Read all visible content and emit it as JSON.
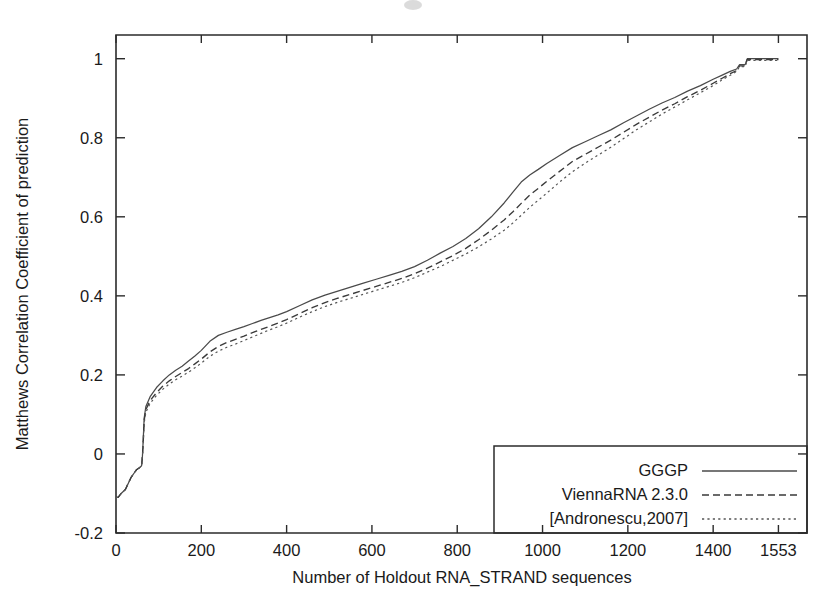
{
  "chart_data": {
    "type": "line",
    "title": "",
    "subtitle": "",
    "xlabel": "Number of Holdout RNA_STRAND sequences",
    "ylabel": "Matthews Correlation Coefficient of prediction",
    "xlim": [
      0,
      1620
    ],
    "ylim": [
      -0.2,
      1.06
    ],
    "grid": false,
    "legend_position": "bottom-right",
    "xticks": [
      0,
      200,
      400,
      600,
      800,
      1000,
      1200,
      1400,
      1553
    ],
    "xticklabels": [
      "0",
      "200",
      "400",
      "600",
      "800",
      "1000",
      "1200",
      "1400",
      "1553"
    ],
    "yticks": [
      -0.2,
      0,
      0.2,
      0.4,
      0.6,
      0.8,
      1
    ],
    "yticklabels": [
      "-0.2",
      "0",
      "0.2",
      "0.4",
      "0.6",
      "0.8",
      "1"
    ],
    "series": [
      {
        "name": "GGGP",
        "style": "solid",
        "color": "#4a4a4a",
        "x": [
          0,
          5,
          12,
          22,
          35,
          48,
          55,
          60,
          62,
          64,
          66,
          70,
          80,
          95,
          110,
          125,
          140,
          155,
          170,
          185,
          200,
          220,
          240,
          260,
          280,
          300,
          320,
          340,
          360,
          380,
          400,
          430,
          460,
          490,
          520,
          550,
          580,
          610,
          640,
          670,
          700,
          730,
          760,
          790,
          820,
          850,
          880,
          910,
          930,
          950,
          970,
          990,
          1010,
          1040,
          1070,
          1100,
          1130,
          1160,
          1190,
          1220,
          1250,
          1280,
          1310,
          1340,
          1370,
          1400,
          1420,
          1440,
          1455,
          1462,
          1468,
          1475,
          1480,
          1490,
          1500,
          1520,
          1540,
          1553
        ],
        "y": [
          -0.11,
          -0.11,
          -0.1,
          -0.09,
          -0.06,
          -0.04,
          -0.035,
          -0.03,
          -0.005,
          0.04,
          0.09,
          0.12,
          0.145,
          0.168,
          0.185,
          0.2,
          0.212,
          0.222,
          0.235,
          0.248,
          0.262,
          0.285,
          0.3,
          0.308,
          0.315,
          0.322,
          0.33,
          0.338,
          0.345,
          0.352,
          0.36,
          0.375,
          0.39,
          0.402,
          0.412,
          0.422,
          0.432,
          0.442,
          0.452,
          0.462,
          0.474,
          0.49,
          0.508,
          0.525,
          0.545,
          0.57,
          0.6,
          0.635,
          0.662,
          0.688,
          0.706,
          0.72,
          0.735,
          0.755,
          0.775,
          0.79,
          0.805,
          0.82,
          0.838,
          0.855,
          0.872,
          0.888,
          0.902,
          0.918,
          0.932,
          0.948,
          0.958,
          0.968,
          0.974,
          0.985,
          0.985,
          0.985,
          1.0,
          1.0,
          1.0,
          1.0,
          1.0,
          1.0
        ]
      },
      {
        "name": "ViennaRNA 2.3.0",
        "style": "dashed",
        "color": "#3a3a3a",
        "x": [
          0,
          5,
          12,
          22,
          35,
          48,
          55,
          60,
          62,
          64,
          66,
          70,
          80,
          95,
          110,
          125,
          140,
          155,
          170,
          185,
          200,
          220,
          240,
          260,
          280,
          300,
          320,
          340,
          360,
          380,
          400,
          430,
          460,
          490,
          520,
          550,
          580,
          610,
          640,
          670,
          700,
          730,
          760,
          790,
          820,
          850,
          880,
          910,
          930,
          950,
          970,
          990,
          1010,
          1040,
          1070,
          1100,
          1130,
          1160,
          1190,
          1220,
          1250,
          1280,
          1310,
          1340,
          1370,
          1400,
          1420,
          1440,
          1455,
          1462,
          1468,
          1475,
          1480,
          1490,
          1500,
          1520,
          1540,
          1553
        ],
        "y": [
          -0.11,
          -0.11,
          -0.1,
          -0.09,
          -0.06,
          -0.04,
          -0.035,
          -0.03,
          -0.005,
          0.035,
          0.085,
          0.112,
          0.135,
          0.155,
          0.172,
          0.185,
          0.196,
          0.206,
          0.216,
          0.228,
          0.24,
          0.258,
          0.272,
          0.282,
          0.29,
          0.298,
          0.307,
          0.315,
          0.323,
          0.331,
          0.34,
          0.355,
          0.37,
          0.383,
          0.394,
          0.404,
          0.414,
          0.424,
          0.434,
          0.444,
          0.456,
          0.47,
          0.486,
          0.502,
          0.52,
          0.542,
          0.566,
          0.592,
          0.612,
          0.634,
          0.655,
          0.672,
          0.69,
          0.715,
          0.74,
          0.758,
          0.776,
          0.794,
          0.814,
          0.834,
          0.852,
          0.87,
          0.886,
          0.904,
          0.92,
          0.938,
          0.95,
          0.962,
          0.97,
          0.982,
          0.982,
          0.982,
          0.998,
          0.998,
          0.998,
          0.998,
          0.998,
          0.998
        ]
      },
      {
        "name": "[Andronescu,2007]",
        "style": "dotted",
        "color": "#555555",
        "x": [
          0,
          5,
          12,
          22,
          35,
          48,
          55,
          60,
          62,
          64,
          66,
          70,
          80,
          95,
          110,
          125,
          140,
          155,
          170,
          185,
          200,
          220,
          240,
          260,
          280,
          300,
          320,
          340,
          360,
          380,
          400,
          430,
          460,
          490,
          520,
          550,
          580,
          610,
          640,
          670,
          700,
          730,
          760,
          790,
          820,
          850,
          880,
          910,
          930,
          950,
          970,
          990,
          1010,
          1040,
          1070,
          1100,
          1130,
          1160,
          1190,
          1220,
          1250,
          1280,
          1310,
          1340,
          1370,
          1400,
          1420,
          1440,
          1455,
          1462,
          1468,
          1475,
          1480,
          1490,
          1500,
          1520,
          1540,
          1553
        ],
        "y": [
          -0.11,
          -0.11,
          -0.1,
          -0.09,
          -0.06,
          -0.04,
          -0.035,
          -0.03,
          -0.008,
          0.03,
          0.078,
          0.105,
          0.128,
          0.148,
          0.164,
          0.177,
          0.188,
          0.197,
          0.207,
          0.218,
          0.23,
          0.247,
          0.26,
          0.27,
          0.278,
          0.287,
          0.296,
          0.305,
          0.314,
          0.322,
          0.331,
          0.346,
          0.36,
          0.373,
          0.384,
          0.394,
          0.404,
          0.414,
          0.424,
          0.434,
          0.446,
          0.46,
          0.474,
          0.49,
          0.506,
          0.524,
          0.544,
          0.566,
          0.584,
          0.604,
          0.624,
          0.642,
          0.66,
          0.688,
          0.714,
          0.736,
          0.756,
          0.776,
          0.798,
          0.82,
          0.84,
          0.86,
          0.878,
          0.896,
          0.914,
          0.932,
          0.946,
          0.958,
          0.968,
          0.98,
          0.98,
          0.98,
          0.996,
          0.996,
          0.996,
          0.996,
          0.996,
          0.996
        ]
      }
    ]
  },
  "legend": {
    "entries": [
      {
        "label": "GGGP",
        "style": "solid"
      },
      {
        "label": "ViennaRNA 2.3.0",
        "style": "dashed"
      },
      {
        "label": "[Andronescu,2007]",
        "style": "dotted"
      }
    ]
  },
  "colors": {
    "background": "#ffffff",
    "axis": "#2b2b2b",
    "text": "#1a1a1a",
    "series_solid": "#4a4a4a",
    "series_dashed": "#3a3a3a",
    "series_dotted": "#555555"
  }
}
